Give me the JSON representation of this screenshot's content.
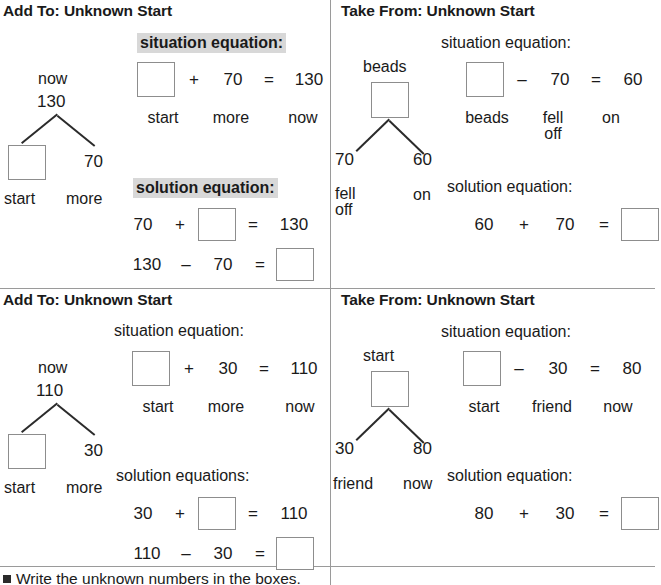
{
  "page": {
    "bottom_instruction": "Write the unknown numbers in the boxes.",
    "bullet_icon": "square-bullet-icon"
  },
  "quadrants": [
    {
      "id": "add-to-unknown-start-1",
      "title": "Add To: Unknown Start",
      "tree": {
        "top_label": "now",
        "top_value": "130",
        "left_node": "",
        "left_node_is_box": true,
        "right_node": "70",
        "left_foot_label": "start",
        "right_foot_label": "more"
      },
      "situation": {
        "heading": "situation equation:",
        "highlighted": true,
        "tokens": [
          "",
          "+",
          "70",
          "=",
          "130"
        ],
        "box_index": 0,
        "labels": [
          "start",
          "more",
          "now"
        ]
      },
      "solution": {
        "heading": "solution equation:",
        "highlighted": true,
        "rows": [
          {
            "tokens": [
              "70",
              "+",
              "",
              "=",
              "130"
            ],
            "box_index": 2
          },
          {
            "tokens": [
              "130",
              "–",
              "70",
              "=",
              ""
            ],
            "box_index": 4
          }
        ]
      }
    },
    {
      "id": "take-from-unknown-start-1",
      "title": "Take From: Unknown Start",
      "tree": {
        "top_label": "beads",
        "top_value": "",
        "top_is_box": true,
        "left_node": "70",
        "right_node": "60",
        "left_foot_label": "fell\noff",
        "right_foot_label": "on"
      },
      "situation": {
        "heading": "situation equation:",
        "highlighted": false,
        "tokens": [
          "",
          "–",
          "70",
          "=",
          "60"
        ],
        "box_index": 0,
        "labels": [
          "beads",
          "fell\noff",
          "on"
        ]
      },
      "solution": {
        "heading": "solution equation:",
        "highlighted": false,
        "rows": [
          {
            "tokens": [
              "60",
              "+",
              "70",
              "=",
              ""
            ],
            "box_index": 4
          }
        ]
      }
    },
    {
      "id": "add-to-unknown-start-2",
      "title": "Add To: Unknown Start",
      "tree": {
        "top_label": "now",
        "top_value": "110",
        "left_node": "",
        "left_node_is_box": true,
        "right_node": "30",
        "left_foot_label": "start",
        "right_foot_label": "more"
      },
      "situation": {
        "heading": "situation equation:",
        "highlighted": false,
        "tokens": [
          "",
          "+",
          "30",
          "=",
          "110"
        ],
        "box_index": 0,
        "labels": [
          "start",
          "more",
          "now"
        ]
      },
      "solution": {
        "heading": "solution equations:",
        "highlighted": false,
        "rows": [
          {
            "tokens": [
              "30",
              "+",
              "",
              "=",
              "110"
            ],
            "box_index": 2
          },
          {
            "tokens": [
              "110",
              "–",
              "30",
              "=",
              ""
            ],
            "box_index": 4
          }
        ]
      }
    },
    {
      "id": "take-from-unknown-start-2",
      "title": "Take From: Unknown Start",
      "tree": {
        "top_label": "start",
        "top_value": "",
        "top_is_box": true,
        "left_node": "30",
        "right_node": "80",
        "left_foot_label": "friend",
        "right_foot_label": "now"
      },
      "situation": {
        "heading": "situation equation:",
        "highlighted": false,
        "tokens": [
          "",
          "–",
          "30",
          "=",
          "80"
        ],
        "box_index": 0,
        "labels": [
          "start",
          "friend",
          "now"
        ]
      },
      "solution": {
        "heading": "solution equation:",
        "highlighted": false,
        "rows": [
          {
            "tokens": [
              "80",
              "+",
              "30",
              "=",
              ""
            ],
            "box_index": 4
          }
        ]
      }
    }
  ],
  "colors": {
    "text": "#1a1a1a",
    "box_border": "#8d8d8d",
    "divider": "#9a9a9a",
    "highlight": "#d8d8d8"
  }
}
